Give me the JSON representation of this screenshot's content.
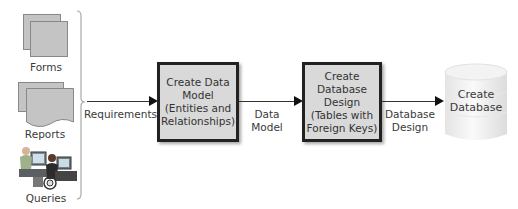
{
  "inputs": {
    "forms": "Forms",
    "reports": "Reports",
    "queries": "Queries"
  },
  "arrows": {
    "requirements": "Requirements",
    "data_model": [
      "Data",
      "Model"
    ],
    "database_design": [
      "Database",
      "Design"
    ]
  },
  "steps": [
    {
      "lines": [
        "Create Data",
        "Model",
        "(Entities and",
        "Relationships)"
      ]
    },
    {
      "lines": [
        "Create",
        "Database",
        "Design",
        "(Tables with",
        "Foreign Keys)"
      ]
    }
  ],
  "output": {
    "lines": [
      "Create",
      "Database"
    ]
  },
  "colors": {
    "box_fill": "#d9d9d9",
    "box_border": "#222222",
    "cylinder": "#f0f0f0"
  }
}
